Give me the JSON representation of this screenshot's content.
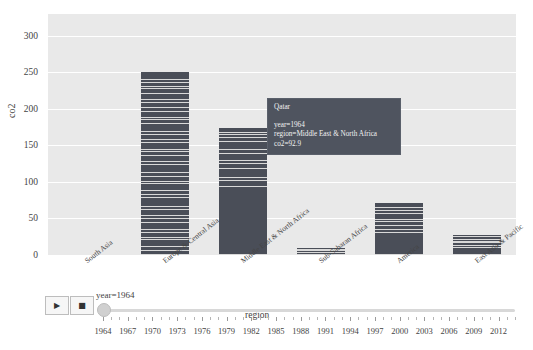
{
  "chart_data": {
    "type": "bar",
    "title": "",
    "xlabel": "region",
    "ylabel": "co2",
    "ylim": [
      0,
      330
    ],
    "ytick_labels": [
      "0",
      "50",
      "100",
      "150",
      "200",
      "250",
      "300"
    ],
    "ytick_values": [
      0,
      50,
      100,
      150,
      200,
      250,
      300
    ],
    "grid": true,
    "stacked": true,
    "legend": "none",
    "categories": [
      "South Asia",
      "Europe & Central Asia",
      "Middle East & North Africa",
      "Sub-Saharan Africa",
      "America",
      "East Asia & Pacific"
    ],
    "values": [
      0,
      251,
      174,
      9,
      71,
      27
    ],
    "series": [
      {
        "name": "co2 total (stacked by country)",
        "values": [
          0,
          251,
          174,
          9,
          71,
          27
        ]
      }
    ],
    "stack_segments": {
      "South Asia": [],
      "Europe & Central Asia": [
        6,
        5,
        9,
        3,
        7,
        4,
        10,
        6,
        3,
        8,
        5,
        12,
        4,
        6,
        9,
        3,
        7,
        5,
        11,
        4,
        8,
        6,
        3,
        9,
        5,
        7,
        4,
        10,
        6,
        3,
        8,
        5,
        7,
        4,
        9,
        6,
        3,
        5,
        4,
        6
      ],
      "Middle East & North Africa": [
        93,
        8,
        5,
        12,
        7,
        4,
        9,
        6,
        11,
        5,
        4,
        3,
        7
      ],
      "Sub-Saharan Africa": [
        3,
        2,
        2,
        2
      ],
      "America": [
        30,
        4,
        6,
        5,
        3,
        8,
        4,
        5,
        6
      ],
      "East Asia & Pacific": [
        9,
        3,
        4,
        2,
        3,
        3,
        3
      ]
    },
    "bar_color": "#4a4e58",
    "plot_background": "#e9e9e9",
    "gridline_color": "#ffffff",
    "annotation_marker": {
      "category": "Middle East & North Africa",
      "country": "Qatar",
      "year": 1964,
      "co2": 92.9
    }
  },
  "tooltip": {
    "title": "Qatar",
    "rows": [
      "year=1964",
      "region=Middle East & North Africa",
      "co2=92.9"
    ],
    "background_color": "#4f545f",
    "text_color": "#f2f2f2"
  },
  "controls": {
    "play_label": "▶",
    "stop_label": "■",
    "slider_label": "year=1964",
    "slider_value": 1964,
    "slider_min": 1964,
    "slider_max": 2014,
    "tick_labels": [
      "1964",
      "1967",
      "1970",
      "1973",
      "1976",
      "1979",
      "1982",
      "1985",
      "1988",
      "1991",
      "1994",
      "1997",
      "2000",
      "2003",
      "2006",
      "2009",
      "2012"
    ]
  }
}
